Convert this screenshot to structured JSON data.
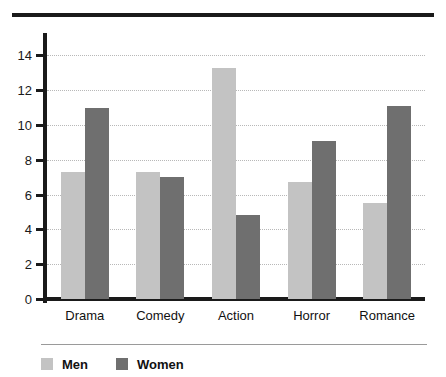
{
  "chart_data": {
    "type": "bar",
    "title": "",
    "subtitle": "",
    "xlabel": "",
    "ylabel": "",
    "categories": [
      "Drama",
      "Comedy",
      "Action",
      "Horror",
      "Romance"
    ],
    "series": [
      {
        "name": "Men",
        "color": "#c3c3c3",
        "values": [
          7.3,
          7.3,
          13.3,
          6.7,
          5.5
        ]
      },
      {
        "name": "Women",
        "color": "#6f6f6f",
        "values": [
          11.0,
          7.0,
          4.8,
          9.1,
          11.1
        ]
      }
    ],
    "ylim": [
      0,
      15
    ],
    "yticks": [
      0,
      2,
      4,
      6,
      8,
      10,
      12,
      14
    ],
    "ytick_labels": [
      "0",
      "2",
      "4",
      "6",
      "8",
      "10",
      "12",
      "14"
    ],
    "grid": "horizontal-dotted",
    "legend_position": "bottom-left",
    "legend_entries": [
      "Men",
      "Women"
    ]
  },
  "figure": {
    "top_rule_color": "#1a1a1a",
    "axis_color": "#1a1a1a",
    "gridline_color": "#b8b8b8",
    "background": "#ffffff"
  }
}
